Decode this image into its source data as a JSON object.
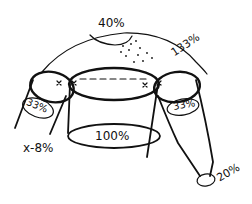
{
  "diagram": {
    "labels": {
      "neck": "40%",
      "yoke": "133%",
      "yoke_dot": "·",
      "body": "100%",
      "sleeve_left_upper": "33%",
      "sleeve_right_upper": "33%",
      "underarm": "x-8%",
      "cuff": "20%"
    },
    "markers": [
      "x",
      "x",
      "x",
      "x"
    ]
  }
}
